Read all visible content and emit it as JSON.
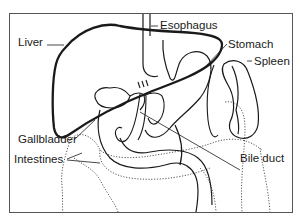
{
  "diagram": {
    "type": "anatomical-illustration",
    "colors": {
      "line": "#1a1a1a",
      "background": "#ffffff",
      "frame": "#555555"
    },
    "labels": [
      {
        "id": "liver",
        "text": "Liver"
      },
      {
        "id": "esophagus",
        "text": "Esophagus"
      },
      {
        "id": "stomach",
        "text": "Stomach"
      },
      {
        "id": "spleen",
        "text": "Spleen"
      },
      {
        "id": "gallbladder",
        "text": "Gallbladder"
      },
      {
        "id": "intestines",
        "text": "Intestines"
      },
      {
        "id": "bile_duct",
        "text": "Bile duct"
      }
    ]
  }
}
